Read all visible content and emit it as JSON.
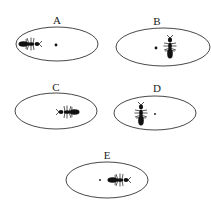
{
  "panels": [
    {
      "label": "A",
      "cx": 57,
      "cy": 44,
      "rx": 41,
      "ry": 17,
      "label_x": 57,
      "label_y": 24,
      "dot": {
        "x": 56,
        "y": 45,
        "r": 1.4
      },
      "ant": {
        "x": 31,
        "y": 44,
        "rotation": 0
      }
    },
    {
      "label": "B",
      "cx": 163,
      "cy": 47,
      "rx": 47,
      "ry": 19,
      "label_x": 157,
      "label_y": 25,
      "dot": {
        "x": 156,
        "y": 48,
        "r": 1.4
      },
      "ant": {
        "x": 170,
        "y": 46,
        "rotation": -90
      }
    },
    {
      "label": "C",
      "cx": 56,
      "cy": 111,
      "rx": 41,
      "ry": 18,
      "label_x": 56,
      "label_y": 91,
      "dot": null,
      "ant": {
        "x": 67,
        "y": 112,
        "rotation": 180
      }
    },
    {
      "label": "D",
      "cx": 155,
      "cy": 113,
      "rx": 41,
      "ry": 17,
      "label_x": 157,
      "label_y": 92,
      "dot": {
        "x": 155,
        "y": 114,
        "r": 0.9
      },
      "ant": {
        "x": 141,
        "y": 113,
        "rotation": -90
      }
    },
    {
      "label": "E",
      "cx": 107,
      "cy": 180,
      "rx": 41,
      "ry": 18,
      "label_x": 107,
      "label_y": 159,
      "dot": {
        "x": 100,
        "y": 180,
        "r": 0.9
      },
      "ant": {
        "x": 120,
        "y": 180,
        "rotation": 0
      }
    }
  ],
  "colors": {
    "ink": "#111111",
    "outline": "#333333",
    "background": "#ffffff"
  }
}
